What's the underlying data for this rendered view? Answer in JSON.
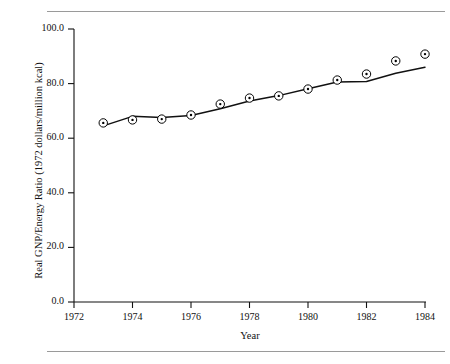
{
  "page": {
    "header_fragment": "",
    "rules": [
      "top-rule",
      "bottom-rule"
    ]
  },
  "chart_data": {
    "type": "line",
    "title": "",
    "subtitle": "",
    "xlabel": "Year",
    "ylabel": "Real GNP/Energy Ratio (1972 dollars/million kcal)",
    "xlim": [
      1972,
      1984
    ],
    "ylim": [
      0.0,
      100.0
    ],
    "xticks": [
      1972,
      1974,
      1976,
      1978,
      1980,
      1982,
      1984
    ],
    "xtick_labels": [
      "1972",
      "1974",
      "1976",
      "1978",
      "1980",
      "1982",
      "1984"
    ],
    "yticks": [
      0.0,
      20.0,
      40.0,
      60.0,
      80.0,
      100.0
    ],
    "ytick_labels": [
      "0.0",
      "20.0",
      "40.0",
      "60.0",
      "80.0",
      "100.0"
    ],
    "grid": false,
    "legend": null,
    "legend_position": "none",
    "marker": "circle-with-center-dot",
    "line_color": "#000000",
    "marker_color": "#000000",
    "x": [
      1973,
      1974,
      1975,
      1976,
      1977,
      1978,
      1979,
      1980,
      1981,
      1982,
      1983,
      1984
    ],
    "values": [
      65.6,
      66.7,
      67.0,
      68.5,
      72.5,
      74.7,
      75.5,
      78.0,
      81.3,
      83.5,
      88.3,
      90.8
    ],
    "series": [
      {
        "name": "Real GNP/Energy Ratio",
        "x": [
          1973,
          1974,
          1975,
          1976,
          1977,
          1978,
          1979,
          1980,
          1981,
          1982,
          1983,
          1984
        ],
        "values": [
          65.6,
          66.7,
          67.0,
          68.5,
          72.5,
          74.7,
          75.5,
          78.0,
          81.3,
          83.5,
          88.3,
          90.8
        ]
      }
    ],
    "trend_line": {
      "name": "smoothed trend",
      "x": [
        1973,
        1974,
        1975,
        1976,
        1977,
        1978,
        1979,
        1980,
        1981,
        1982,
        1983,
        1984
      ],
      "values": [
        64.5,
        68.0,
        67.6,
        68.3,
        70.8,
        73.6,
        75.6,
        78.1,
        80.6,
        80.8,
        83.8,
        86.0
      ]
    }
  }
}
